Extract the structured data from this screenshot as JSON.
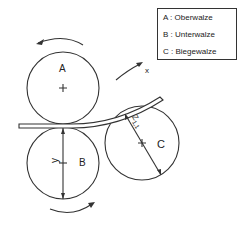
{
  "legend": {
    "items": [
      {
        "key": "A",
        "label": "A : Oberwalze"
      },
      {
        "key": "B",
        "label": "B : Unterwalze"
      },
      {
        "key": "C",
        "label": "C : Biegewalze"
      }
    ]
  },
  "rollers": {
    "A": {
      "label": "A"
    },
    "B": {
      "label": "B"
    },
    "C": {
      "label": "C"
    }
  },
  "dimensions": {
    "y": "y",
    "z": "Z",
    "z_sub": "1,1",
    "x": "x"
  }
}
